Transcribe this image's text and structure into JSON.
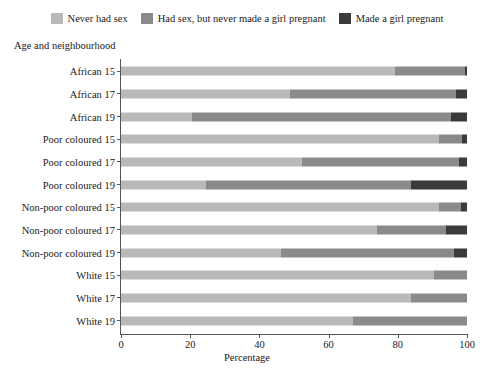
{
  "chart_data": {
    "type": "bar",
    "orientation": "horizontal",
    "stacked": true,
    "normalized": true,
    "title": "",
    "xlabel": "Percentage",
    "ylabel": "Age and neighbourhood",
    "xlim": [
      0,
      100
    ],
    "xticks": [
      0,
      20,
      40,
      60,
      80,
      100
    ],
    "xtick_labels": [
      "0",
      "20",
      "40",
      "60",
      "80",
      "100"
    ],
    "grid": false,
    "legend_position": "top",
    "categories": [
      "African 15",
      "African 17",
      "African 19",
      "Poor coloured 15",
      "Poor coloured 17",
      "Poor coloured 19",
      "Non-poor coloured 15",
      "Non-poor coloured 17",
      "Non-poor coloured 19",
      "White 15",
      "White 17",
      "White 19"
    ],
    "series": [
      {
        "name": "Never had sex",
        "color": "#b9b9b9",
        "values": [
          79.2,
          48.8,
          20.5,
          92.0,
          52.3,
          24.6,
          92.0,
          74.0,
          46.3,
          90.5,
          83.8,
          67.0
        ]
      },
      {
        "name": "Had sex, but never made a girl pregnant",
        "color": "#8a8a8a",
        "values": [
          20.2,
          48.0,
          74.9,
          6.7,
          45.4,
          59.2,
          6.3,
          20.0,
          49.9,
          9.5,
          16.2,
          33.0
        ]
      },
      {
        "name": "Made a girl pregnant",
        "color": "#3b3b3b",
        "values": [
          0.6,
          3.2,
          4.6,
          1.3,
          2.3,
          16.2,
          1.7,
          6.0,
          3.8,
          0.0,
          0.0,
          0.0
        ]
      }
    ]
  },
  "legend": {
    "items": [
      {
        "label": "Never had sex",
        "color": "#b9b9b9",
        "swatch_name": "legend-swatch-never-had-sex"
      },
      {
        "label": "Had sex, but never made a girl pregnant",
        "color": "#8a8a8a",
        "swatch_name": "legend-swatch-had-sex-no-pregnancy"
      },
      {
        "label": "Made a girl pregnant",
        "color": "#3b3b3b",
        "swatch_name": "legend-swatch-made-pregnant"
      }
    ]
  },
  "axes": {
    "y_title": "Age and neighbourhood",
    "x_title": "Percentage"
  },
  "colors": {
    "axis": "#555555",
    "text": "#1a1a1a",
    "background": "#ffffff"
  }
}
